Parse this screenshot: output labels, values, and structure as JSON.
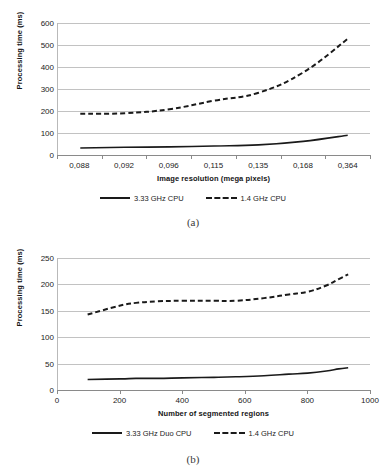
{
  "figures": [
    {
      "id": "a",
      "caption": "(a)",
      "chart_data": {
        "type": "line",
        "title": "",
        "xlabel": "Image resolution (mega pixels)",
        "ylabel": "Processing time (ms)",
        "categories": [
          "0,088",
          "0,092",
          "0,096",
          "0,115",
          "0,135",
          "0,168",
          "0,364"
        ],
        "ylim": [
          0,
          600
        ],
        "yticks": [
          0,
          100,
          200,
          300,
          400,
          500,
          600
        ],
        "grid": true,
        "legend_position": "bottom",
        "series": [
          {
            "name": "3.33 GHz CPU",
            "style": "solid",
            "color": "#1a1a1a",
            "values": [
              32,
              35,
              37,
              41,
              46,
              62,
              90
            ]
          },
          {
            "name": "1.4 GHz CPU",
            "style": "dashed",
            "color": "#1a1a1a",
            "values": [
              187,
              190,
              208,
              247,
              283,
              375,
              528
            ]
          }
        ]
      }
    },
    {
      "id": "b",
      "caption": "(b)",
      "chart_data": {
        "type": "line",
        "title": "",
        "xlabel": "Number of segmented regions",
        "ylabel": "Processing time (ms)",
        "xlim": [
          0,
          1000
        ],
        "xticks": [
          0,
          200,
          400,
          600,
          800,
          1000
        ],
        "ylim": [
          0,
          250
        ],
        "yticks": [
          0,
          50,
          100,
          150,
          200,
          250
        ],
        "grid": true,
        "legend_position": "bottom",
        "x": [
          95,
          200,
          250,
          320,
          400,
          500,
          570,
          660,
          740,
          800,
          860,
          900,
          930
        ],
        "series": [
          {
            "name": "3.33 GHz Duo CPU",
            "style": "solid",
            "color": "#1a1a1a",
            "values": [
              20,
              21,
              22,
              22,
              23,
              24,
              25,
              27,
              30,
              32,
              36,
              40,
              42
            ]
          },
          {
            "name": "1.4 GHz CPU",
            "style": "dashed",
            "color": "#1a1a1a",
            "values": [
              143,
              160,
              165,
              168,
              169,
              169,
              169,
              174,
              181,
              186,
              198,
              210,
              219
            ]
          }
        ]
      }
    }
  ]
}
